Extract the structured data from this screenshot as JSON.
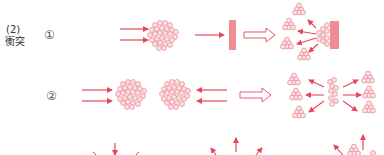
{
  "section": {
    "number": "(2)",
    "title": "衝突"
  },
  "steps": [
    {
      "label": "①",
      "description": "two clusters: particles hitting a wall, then scattering back"
    },
    {
      "label": "②",
      "description": "two clusters collide head-on, then scatter in all directions"
    }
  ],
  "colors": {
    "arrow": "#e8475a",
    "particle_stroke": "#e88a93",
    "particle_fill": "#fbe3e5",
    "wall": "#f28c94",
    "hollow_arrow": "#e8475a",
    "text": "#333333"
  }
}
